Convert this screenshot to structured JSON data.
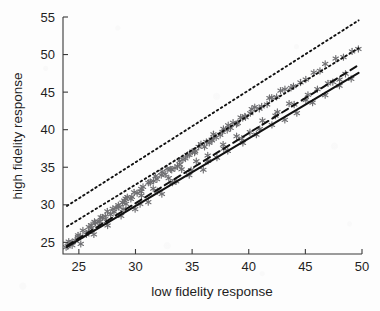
{
  "chart_data": {
    "type": "scatter",
    "title": "",
    "xlabel": "low fidelity response",
    "ylabel": "high fidelity response",
    "xlim": [
      23.6,
      50.0
    ],
    "ylim": [
      23.45,
      55.0
    ],
    "xticks": [
      25,
      30,
      35,
      40,
      45,
      50
    ],
    "yticks": [
      25,
      30,
      35,
      40,
      45,
      50,
      55
    ],
    "xtick_labels": [
      "25",
      "30",
      "35",
      "40",
      "45",
      "50"
    ],
    "ytick_labels": [
      "25",
      "30",
      "35",
      "40",
      "45",
      "50",
      "55"
    ],
    "grid": false,
    "legend": "none",
    "marker": "asterisk",
    "marker_color": "#6f6f72",
    "series": [
      {
        "name": "observations",
        "type": "scatter",
        "x": [
          23.9,
          24.0,
          24.2,
          24.4,
          24.6,
          24.8,
          25.0,
          25.2,
          25.4,
          25.6,
          25.8,
          26.0,
          26.2,
          26.4,
          26.6,
          26.8,
          27.0,
          27.2,
          27.4,
          27.6,
          27.8,
          28.0,
          28.2,
          28.4,
          28.6,
          28.8,
          29.0,
          29.2,
          29.4,
          29.6,
          29.8,
          30.0,
          30.2,
          30.4,
          30.6,
          30.8,
          31.0,
          31.2,
          31.4,
          31.6,
          31.8,
          32.0,
          32.2,
          32.4,
          32.6,
          32.8,
          33.0,
          33.2,
          33.4,
          33.6,
          33.8,
          34.0,
          34.2,
          34.4,
          34.6,
          34.8,
          35.0,
          35.2,
          35.4,
          35.6,
          35.8,
          36.0,
          36.2,
          36.4,
          36.6,
          36.8,
          37.0,
          37.2,
          37.4,
          37.6,
          37.8,
          38.0,
          38.2,
          38.4,
          38.6,
          38.8,
          39.0,
          39.2,
          39.4,
          39.6,
          39.8,
          40.0,
          40.3,
          40.6,
          40.9,
          41.2,
          41.5,
          41.8,
          42.1,
          42.4,
          42.8,
          43.2,
          43.6,
          44.0,
          44.5,
          45.0,
          45.6,
          46.2,
          46.9,
          47.6,
          48.3,
          49.0,
          49.6,
          25.1,
          26.3,
          27.5,
          28.7,
          29.9,
          31.1,
          32.3,
          33.5,
          34.7,
          35.9,
          37.1,
          38.3,
          39.5,
          40.7,
          41.9,
          43.1,
          44.3,
          45.5,
          46.7,
          47.9,
          49.1,
          26.9,
          28.1,
          29.3,
          30.5,
          31.7,
          32.9,
          34.1,
          35.3,
          36.5,
          37.7,
          38.9,
          40.1,
          41.3,
          42.5,
          43.7,
          44.9,
          46.1,
          47.3,
          48.5,
          24.5,
          25.9,
          27.3,
          28.9,
          30.3,
          31.9,
          33.3,
          34.9,
          36.3,
          37.9,
          39.3,
          40.9,
          42.3,
          43.9,
          45.3,
          46.9,
          48.1
        ],
        "y": [
          24.5,
          24.6,
          24.9,
          25.1,
          25.2,
          25.5,
          25.8,
          26.0,
          26.3,
          26.4,
          26.7,
          27.0,
          27.2,
          27.4,
          27.6,
          27.9,
          28.1,
          28.4,
          28.5,
          28.8,
          29.0,
          29.3,
          29.4,
          29.7,
          29.9,
          30.1,
          30.3,
          30.6,
          30.8,
          31.0,
          31.2,
          31.5,
          31.7,
          31.9,
          32.1,
          32.4,
          32.6,
          32.8,
          33.0,
          33.2,
          33.5,
          33.7,
          33.9,
          34.1,
          34.3,
          34.6,
          34.8,
          35.0,
          35.2,
          35.4,
          35.7,
          35.9,
          36.1,
          36.3,
          36.5,
          36.7,
          37.0,
          37.2,
          37.4,
          37.6,
          37.8,
          38.0,
          38.2,
          38.4,
          38.7,
          38.9,
          39.1,
          39.3,
          39.5,
          39.7,
          39.9,
          40.1,
          40.3,
          40.5,
          40.8,
          41.0,
          41.2,
          41.4,
          41.6,
          41.8,
          42.0,
          42.2,
          42.5,
          42.8,
          43.1,
          43.4,
          43.7,
          44.0,
          44.2,
          44.5,
          44.9,
          45.3,
          45.6,
          46.0,
          46.5,
          46.9,
          47.5,
          48.0,
          48.6,
          49.2,
          49.8,
          50.4,
          50.9,
          25.0,
          26.2,
          27.3,
          28.4,
          29.5,
          30.6,
          31.7,
          32.8,
          33.8,
          34.9,
          36.0,
          37.1,
          38.2,
          39.2,
          40.3,
          41.4,
          42.4,
          43.5,
          44.6,
          45.6,
          46.7,
          27.9,
          29.0,
          30.1,
          31.2,
          32.3,
          33.4,
          34.5,
          35.6,
          36.7,
          37.8,
          38.8,
          39.9,
          41.0,
          42.1,
          43.2,
          44.2,
          45.3,
          46.4,
          47.4,
          24.9,
          26.2,
          27.6,
          29.1,
          30.4,
          31.9,
          33.2,
          34.7,
          36.0,
          37.5,
          38.8,
          40.3,
          41.6,
          43.1,
          44.4,
          45.9,
          47.0
        ]
      },
      {
        "name": "fit-solid",
        "type": "line",
        "style": "solid",
        "color": "#111111",
        "x": [
          23.95,
          49.7
        ],
        "y": [
          24.4,
          47.55
        ]
      },
      {
        "name": "fit-dashed",
        "type": "line",
        "style": "dashed",
        "color": "#111111",
        "x": [
          23.95,
          49.7
        ],
        "y": [
          24.55,
          48.6
        ]
      },
      {
        "name": "band-lower-dotted",
        "type": "line",
        "style": "dotted",
        "color": "#111111",
        "x": [
          23.95,
          49.7
        ],
        "y": [
          27.1,
          50.85
        ]
      },
      {
        "name": "band-upper-dotted",
        "type": "line",
        "style": "dotted",
        "color": "#111111",
        "x": [
          23.95,
          49.7
        ],
        "y": [
          29.85,
          54.55
        ]
      }
    ]
  }
}
